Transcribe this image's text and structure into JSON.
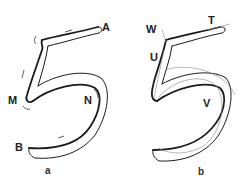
{
  "figure": {
    "panel_a": {
      "caption": "a",
      "labels": {
        "A": "A",
        "M": "M",
        "N": "N",
        "B": "B"
      }
    },
    "panel_b": {
      "caption": "b",
      "labels": {
        "W": "W",
        "T": "T",
        "U": "U",
        "V": "V"
      }
    }
  },
  "colors": {
    "stroke": "#1a1a1a",
    "guide": "#888888",
    "background": "#ffffff"
  }
}
